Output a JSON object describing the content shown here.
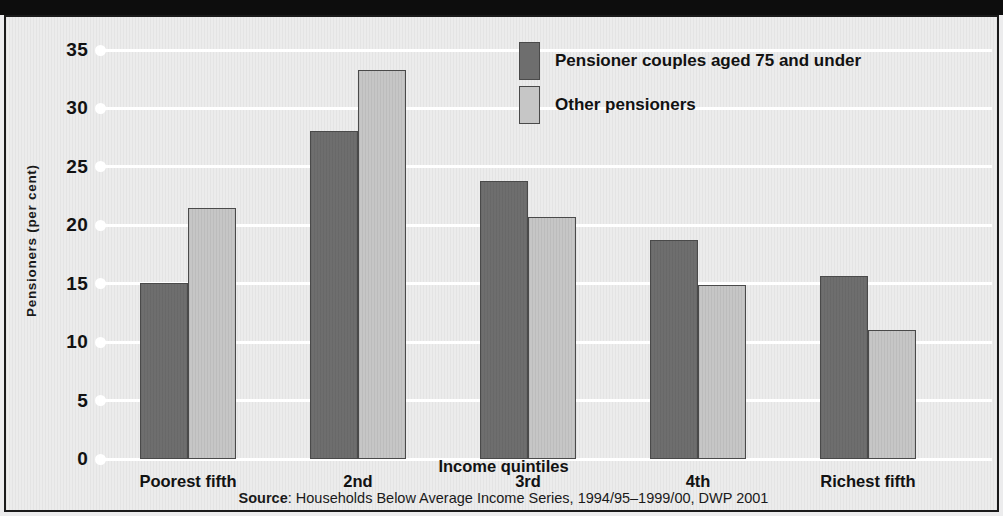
{
  "figure": {
    "background_color": "#ececec",
    "top_band_color": "#0d0d0d",
    "border_color": "#1a1a1a"
  },
  "source": {
    "prefix": "Source",
    "separator": ": ",
    "text": "Households Below Average Income Series, 1994/95–1999/00, DWP 2001"
  },
  "chart_data": {
    "type": "bar",
    "title": "",
    "subtitle": "",
    "xlabel": "Income quintiles",
    "ylabel": "Pensioners (per cent)",
    "categories": [
      "Poorest fifth",
      "2nd",
      "3rd",
      "4th",
      "Richest fifth"
    ],
    "series": [
      {
        "name": "Pensioner couples aged 75 and under",
        "color": "#6e6e6e",
        "values": [
          15.1,
          28.1,
          23.8,
          18.7,
          15.7
        ]
      },
      {
        "name": "Other pensioners",
        "color": "#c6c6c6",
        "values": [
          21.5,
          33.3,
          20.7,
          14.9,
          11.0
        ]
      }
    ],
    "ylim": [
      0,
      35
    ],
    "yticks": [
      0,
      5,
      10,
      15,
      20,
      25,
      30,
      35
    ],
    "ytick_labels": [
      "0",
      "5",
      "10",
      "15",
      "20",
      "25",
      "30",
      "35"
    ],
    "grid": true,
    "grid_color": "#ffffff",
    "legend_position": "top-center",
    "bar_border_color": "#4a4a4a"
  }
}
